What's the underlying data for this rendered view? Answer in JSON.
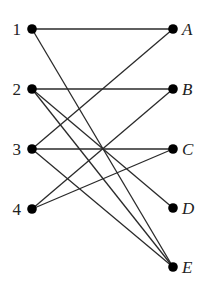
{
  "diagram": {
    "type": "bipartite-graph",
    "left_nodes": [
      {
        "id": "1",
        "label": "1",
        "x": 32,
        "y": 29
      },
      {
        "id": "2",
        "label": "2",
        "x": 32,
        "y": 89
      },
      {
        "id": "3",
        "label": "3",
        "x": 32,
        "y": 149
      },
      {
        "id": "4",
        "label": "4",
        "x": 32,
        "y": 209
      }
    ],
    "right_nodes": [
      {
        "id": "A",
        "label": "A",
        "x": 173,
        "y": 29
      },
      {
        "id": "B",
        "label": "B",
        "x": 173,
        "y": 89
      },
      {
        "id": "C",
        "label": "C",
        "x": 173,
        "y": 149
      },
      {
        "id": "D",
        "label": "D",
        "x": 173,
        "y": 208
      },
      {
        "id": "E",
        "label": "E",
        "x": 173,
        "y": 267
      }
    ],
    "edges": [
      {
        "from": "1",
        "to": "A"
      },
      {
        "from": "1",
        "to": "E"
      },
      {
        "from": "2",
        "to": "B"
      },
      {
        "from": "2",
        "to": "D"
      },
      {
        "from": "2",
        "to": "E"
      },
      {
        "from": "3",
        "to": "A"
      },
      {
        "from": "3",
        "to": "C"
      },
      {
        "from": "3",
        "to": "E"
      },
      {
        "from": "4",
        "to": "B"
      },
      {
        "from": "4",
        "to": "C"
      }
    ],
    "colors": {
      "node": "#000000",
      "edge": "#2a2a2a",
      "label": "#222222",
      "background": "#ffffff"
    }
  }
}
